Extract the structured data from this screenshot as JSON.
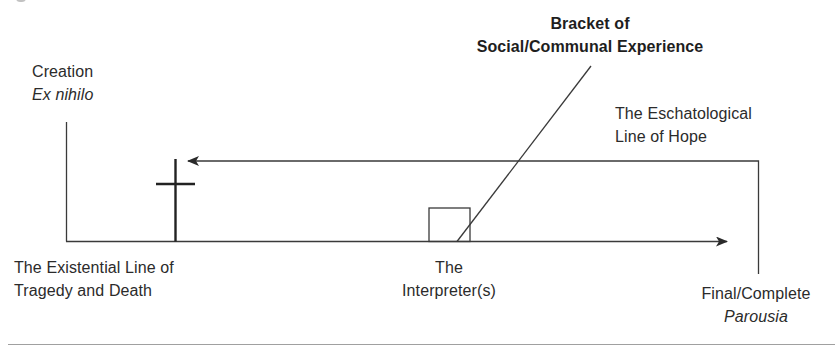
{
  "diagram": {
    "colors": {
      "line": "#333333",
      "text": "#2b2b2b",
      "background": "#ffffff",
      "rule": "#999999"
    },
    "labels": {
      "creation": {
        "line1": "Creation",
        "line2": "Ex nihilo"
      },
      "bracket": {
        "line1": "Bracket of",
        "line2": "Social/Communal Experience"
      },
      "eschatological": {
        "line1": "The Eschatological",
        "line2": "Line of Hope"
      },
      "existential": {
        "line1": "The Existential Line of",
        "line2": "Tragedy and Death"
      },
      "interpreter": {
        "line1": "The",
        "line2": "Interpreter(s)"
      },
      "final": {
        "line1": "Final/Complete",
        "line2": "Parousia"
      }
    },
    "icons": {
      "cross": "cross-icon",
      "interpreter_box": "square-box"
    }
  }
}
